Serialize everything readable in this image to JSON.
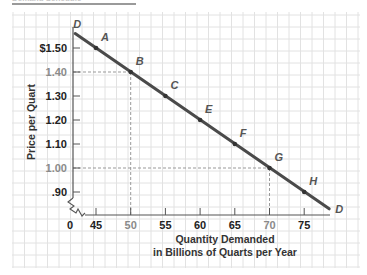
{
  "header": {
    "title": "Demand Schedule"
  },
  "chart_data": {
    "type": "line",
    "title": "",
    "xlabel": "Quantity Demanded in Billions of Quarts per Year",
    "xlabel_lines": [
      "Quantity Demanded",
      "in Billions of Quarts per Year"
    ],
    "ylabel": "Price per Quart",
    "x_ticks": [
      "0",
      "45",
      "50",
      "55",
      "60",
      "65",
      "70",
      "75"
    ],
    "y_ticks": [
      "$1.50",
      "1.40",
      "1.30",
      "1.20",
      "1.10",
      "1.00",
      ".90"
    ],
    "xlim": [
      40,
      80
    ],
    "ylim": [
      0.8,
      1.6
    ],
    "grid": true,
    "axis_break": true,
    "curve_label": "D",
    "series": [
      {
        "name": "D",
        "points": [
          {
            "label": "A",
            "x": 45,
            "y": 1.5
          },
          {
            "label": "B",
            "x": 50,
            "y": 1.4
          },
          {
            "label": "C",
            "x": 55,
            "y": 1.3
          },
          {
            "label": "E",
            "x": 60,
            "y": 1.2
          },
          {
            "label": "F",
            "x": 65,
            "y": 1.1
          },
          {
            "label": "G",
            "x": 70,
            "y": 1.0
          },
          {
            "label": "H",
            "x": 75,
            "y": 0.9
          }
        ]
      }
    ],
    "highlighted": [
      {
        "point": "B",
        "x": 50,
        "y": 1.4
      },
      {
        "point": "G",
        "x": 70,
        "y": 1.0
      }
    ],
    "colors": {
      "line": "#4a4a4a",
      "grid": "#e2e2e2",
      "highlight_text": "#8a8a8a",
      "text": "#222222"
    }
  }
}
